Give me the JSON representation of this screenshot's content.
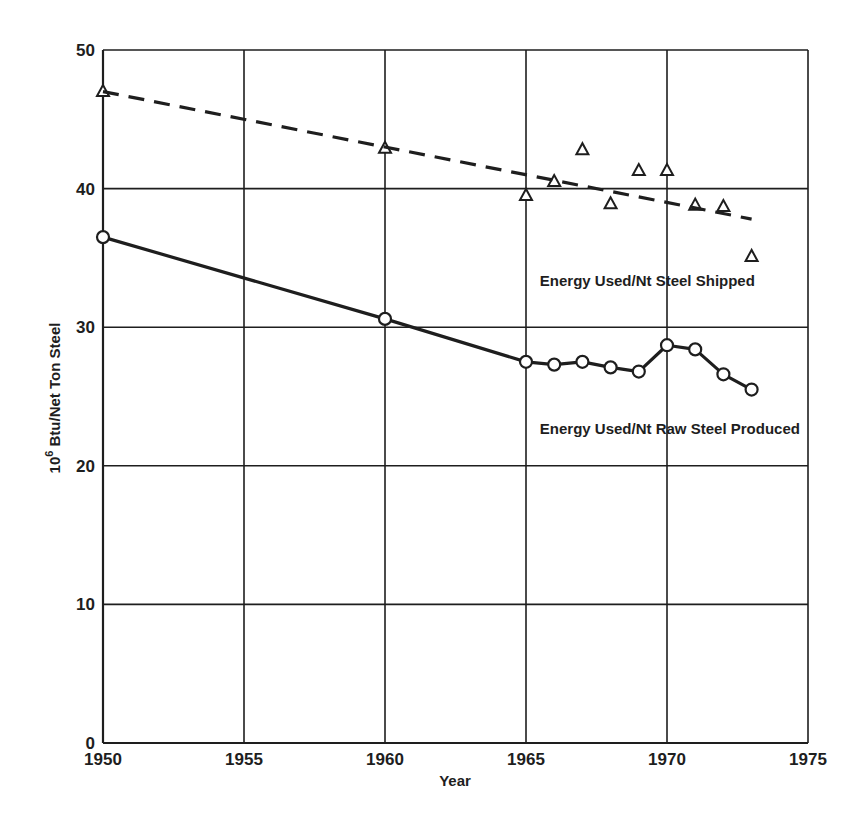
{
  "chart_data": {
    "type": "line",
    "title": "",
    "xlabel": "Year",
    "ylabel": "10^6 Btu/Net Ton Steel",
    "ylabel_parts": {
      "base": "10",
      "sup": "6",
      "rest": " Btu/Net Ton Steel"
    },
    "xlim": [
      1950,
      1975
    ],
    "ylim": [
      0,
      50
    ],
    "xticks": [
      1950,
      1955,
      1960,
      1965,
      1970,
      1975
    ],
    "yticks": [
      0,
      10,
      20,
      30,
      40,
      50
    ],
    "grid": true,
    "series": [
      {
        "name": "Energy Used/Nt Steel Shipped",
        "marker": "triangle",
        "line": "none",
        "x": [
          1950,
          1960,
          1965,
          1966,
          1967,
          1968,
          1969,
          1970,
          1971,
          1972,
          1973
        ],
        "values": [
          47.0,
          42.9,
          39.5,
          40.5,
          42.8,
          38.9,
          41.3,
          41.3,
          38.8,
          38.7,
          35.1
        ],
        "label_pos": {
          "x": 1966.2,
          "y": 33.0
        }
      },
      {
        "name": "Trend: Energy Used/Nt Steel Shipped",
        "marker": "none",
        "line": "dashed",
        "x": [
          1950,
          1973
        ],
        "values": [
          47.0,
          37.8
        ]
      },
      {
        "name": "Energy Used/Nt Raw Steel Produced",
        "marker": "circle",
        "line": "solid",
        "x": [
          1950,
          1960,
          1965,
          1966,
          1967,
          1968,
          1969,
          1970,
          1971,
          1972,
          1973
        ],
        "values": [
          36.5,
          30.6,
          27.5,
          27.3,
          27.5,
          27.1,
          26.8,
          28.7,
          28.4,
          26.6,
          25.5
        ],
        "label_pos": {
          "x": 1966.2,
          "y": 22.3
        }
      }
    ]
  },
  "colors": {
    "ink": "#1e1e1e",
    "background": "#ffffff"
  }
}
